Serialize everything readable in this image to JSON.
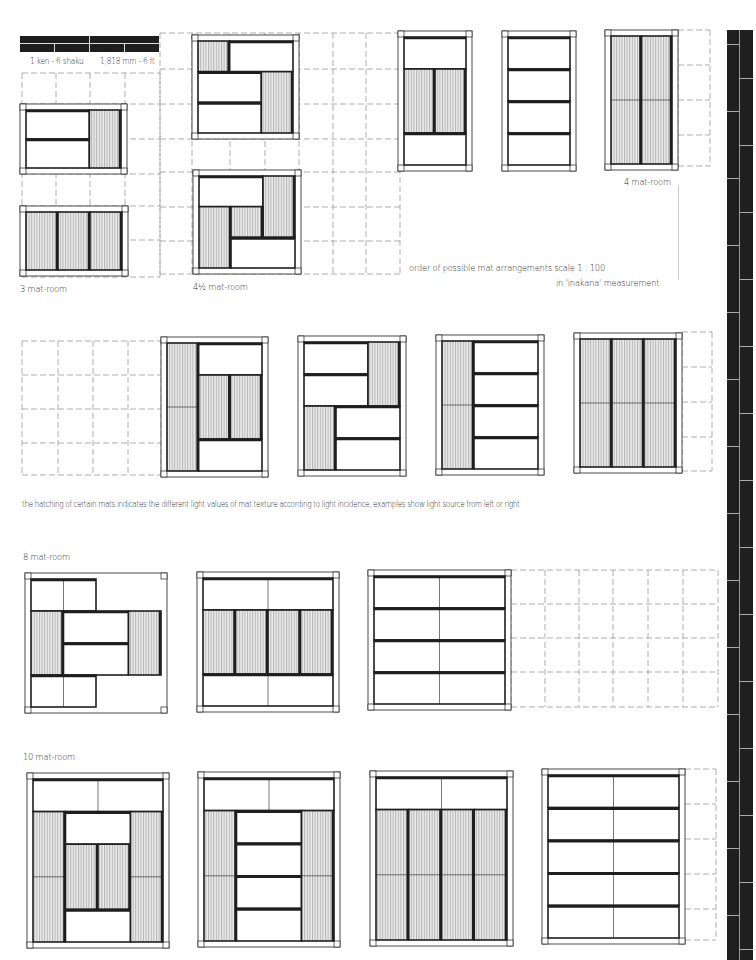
{
  "scale_bar": {
    "label_left": "1 ken - 6 shaku",
    "label_right": "1,818 mm - 6 ft"
  },
  "labels": {
    "three_mat": "3 mat-room",
    "four_half_mat": "4½ mat-room",
    "four_mat": "4 mat-room",
    "order_line1": "order of possible mat arrangements    scale   1 : 100",
    "order_line2": "in 'inakana' measurement",
    "hatching_note": "the hatching of certain mats indicates  the different light values of mat texture according to light incidence, examples show light source from left or right",
    "eight_mat": "8 mat-room",
    "ten_mat": "10 mat-room"
  },
  "colors": {
    "ink": "#1e1e1e",
    "hatch_bg": "#e8e8e8",
    "hatch_line": "#9a9a9a",
    "grid_dash": "#9a9a9a",
    "paper": "#ffffff"
  },
  "rooms": [
    {
      "id": "r3a",
      "group": "3 mat-room",
      "x": 20,
      "y": 104,
      "w": 107,
      "h": 70,
      "mats": [
        [
          0,
          0,
          2,
          1,
          "h"
        ],
        [
          0,
          1,
          2,
          1,
          "h"
        ],
        [
          2,
          0,
          1,
          2,
          "v"
        ]
      ],
      "cols": 3,
      "rows": 2
    },
    {
      "id": "r3b",
      "group": "3 mat-room",
      "x": 20,
      "y": 206,
      "w": 108,
      "h": 70,
      "mats": [
        [
          0,
          0,
          1,
          2,
          "v"
        ],
        [
          1,
          0,
          1,
          2,
          "v"
        ],
        [
          2,
          0,
          1,
          2,
          "v"
        ]
      ],
      "cols": 3,
      "rows": 2
    },
    {
      "id": "r45a",
      "group": "4½ mat-room",
      "x": 192,
      "y": 35,
      "w": 107,
      "h": 104,
      "mats": [
        [
          0,
          0,
          1,
          1,
          "v",
          "sq"
        ],
        [
          1,
          0,
          2,
          1,
          "h"
        ],
        [
          0,
          1,
          2,
          1,
          "h"
        ],
        [
          0,
          2,
          2,
          1,
          "h"
        ],
        [
          2,
          1,
          1,
          2,
          "v"
        ]
      ],
      "cols": 3,
      "rows": 3
    },
    {
      "id": "r45b",
      "group": "4½ mat-room",
      "x": 193,
      "y": 170,
      "w": 108,
      "h": 104,
      "mats": [
        [
          0,
          0,
          2,
          1,
          "h"
        ],
        [
          2,
          0,
          1,
          2,
          "v"
        ],
        [
          0,
          1,
          1,
          2,
          "v"
        ],
        [
          1,
          1,
          1,
          1,
          "v",
          "sq"
        ],
        [
          1,
          2,
          2,
          1,
          "h"
        ]
      ],
      "cols": 3,
      "rows": 3
    },
    {
      "id": "r4a",
      "group": "4 mat-room",
      "x": 398,
      "y": 31,
      "w": 74,
      "h": 140,
      "mats": [
        [
          0,
          0,
          2,
          1,
          "h"
        ],
        [
          0,
          1,
          1,
          2,
          "v"
        ],
        [
          1,
          1,
          1,
          2,
          "v"
        ],
        [
          0,
          3,
          2,
          1,
          "h"
        ]
      ],
      "cols": 2,
      "rows": 4
    },
    {
      "id": "r4b",
      "group": "4 mat-room",
      "x": 502,
      "y": 31,
      "w": 74,
      "h": 140,
      "mats": [
        [
          0,
          0,
          2,
          1,
          "h"
        ],
        [
          0,
          1,
          2,
          1,
          "h"
        ],
        [
          0,
          2,
          2,
          1,
          "h"
        ],
        [
          0,
          3,
          2,
          1,
          "h"
        ]
      ],
      "cols": 2,
      "rows": 4
    },
    {
      "id": "r4c",
      "group": "4 mat-room",
      "x": 605,
      "y": 30,
      "w": 73,
      "h": 140,
      "mats": [
        [
          0,
          0,
          1,
          4,
          "v",
          "split"
        ],
        [
          1,
          0,
          1,
          4,
          "v",
          "split"
        ]
      ],
      "cols": 2,
      "rows": 4
    },
    {
      "id": "r6a",
      "group": "6 mat-room",
      "x": 161,
      "y": 337,
      "w": 107,
      "h": 140,
      "mats": [
        [
          0,
          0,
          1,
          4,
          "v",
          "split"
        ],
        [
          1,
          0,
          2,
          1,
          "h"
        ],
        [
          1,
          1,
          1,
          2,
          "v"
        ],
        [
          2,
          1,
          1,
          2,
          "v"
        ],
        [
          1,
          3,
          2,
          1,
          "h"
        ]
      ],
      "cols": 3,
      "rows": 4
    },
    {
      "id": "r6b",
      "group": "6 mat-room",
      "x": 298,
      "y": 336,
      "w": 108,
      "h": 140,
      "mats": [
        [
          0,
          0,
          2,
          1,
          "h"
        ],
        [
          0,
          1,
          2,
          1,
          "h"
        ],
        [
          2,
          0,
          1,
          2,
          "v"
        ],
        [
          0,
          2,
          1,
          2,
          "v"
        ],
        [
          1,
          2,
          2,
          1,
          "h"
        ],
        [
          1,
          3,
          2,
          1,
          "h"
        ]
      ],
      "cols": 3,
      "rows": 4
    },
    {
      "id": "r6c",
      "group": "6 mat-room",
      "x": 436,
      "y": 335,
      "w": 108,
      "h": 140,
      "mats": [
        [
          0,
          0,
          1,
          4,
          "v",
          "split"
        ],
        [
          1,
          0,
          2,
          1,
          "h"
        ],
        [
          1,
          1,
          2,
          1,
          "h"
        ],
        [
          1,
          2,
          2,
          1,
          "h"
        ],
        [
          1,
          3,
          2,
          1,
          "h"
        ]
      ],
      "cols": 3,
      "rows": 4
    },
    {
      "id": "r6d",
      "group": "6 mat-room",
      "x": 574,
      "y": 333,
      "w": 108,
      "h": 140,
      "mats": [
        [
          0,
          0,
          1,
          4,
          "v",
          "split"
        ],
        [
          1,
          0,
          1,
          4,
          "v",
          "split"
        ],
        [
          2,
          0,
          1,
          4,
          "v",
          "split"
        ]
      ],
      "cols": 3,
      "rows": 4
    },
    {
      "id": "r8a",
      "group": "8 mat-room",
      "x": 25,
      "y": 573,
      "w": 142,
      "h": 140,
      "mats": [
        [
          0,
          0,
          2,
          1,
          "h",
          "split"
        ],
        [
          0,
          1,
          1,
          2,
          "v"
        ],
        [
          1,
          1,
          2,
          1,
          "h"
        ],
        [
          1,
          2,
          2,
          1,
          "h"
        ],
        [
          3,
          1,
          1,
          2,
          "v"
        ],
        [
          0,
          3,
          2,
          1,
          "h",
          "split"
        ]
      ],
      "cols": 4,
      "rows": 4
    },
    {
      "id": "r8b",
      "group": "8 mat-room",
      "x": 197,
      "y": 572,
      "w": 142,
      "h": 140,
      "mats": [
        [
          0,
          0,
          4,
          1,
          "h",
          "split"
        ],
        [
          0,
          1,
          1,
          2,
          "v"
        ],
        [
          1,
          1,
          1,
          2,
          "v"
        ],
        [
          2,
          1,
          1,
          2,
          "v"
        ],
        [
          3,
          1,
          1,
          2,
          "v"
        ],
        [
          0,
          3,
          4,
          1,
          "h",
          "split"
        ]
      ],
      "cols": 4,
      "rows": 4
    },
    {
      "id": "r8c",
      "group": "8 mat-room",
      "x": 368,
      "y": 570,
      "w": 143,
      "h": 140,
      "mats": [
        [
          0,
          0,
          4,
          1,
          "h",
          "split"
        ],
        [
          0,
          1,
          4,
          1,
          "h",
          "split"
        ],
        [
          0,
          2,
          4,
          1,
          "h",
          "split"
        ],
        [
          0,
          3,
          4,
          1,
          "h",
          "split"
        ]
      ],
      "cols": 4,
      "rows": 4
    },
    {
      "id": "r10a",
      "group": "10 mat-room",
      "x": 27,
      "y": 773,
      "w": 142,
      "h": 175,
      "mats": [
        [
          0,
          0,
          4,
          1,
          "h",
          "split"
        ],
        [
          0,
          1,
          1,
          4,
          "v",
          "split"
        ],
        [
          1,
          1,
          2,
          1,
          "h"
        ],
        [
          1,
          2,
          1,
          2,
          "v"
        ],
        [
          2,
          2,
          1,
          2,
          "v"
        ],
        [
          1,
          4,
          2,
          1,
          "h"
        ],
        [
          3,
          1,
          1,
          4,
          "v",
          "split"
        ]
      ],
      "cols": 4,
      "rows": 5
    },
    {
      "id": "r10b",
      "group": "10 mat-room",
      "x": 198,
      "y": 772,
      "w": 142,
      "h": 175,
      "mats": [
        [
          0,
          0,
          4,
          1,
          "h",
          "split"
        ],
        [
          0,
          1,
          1,
          4,
          "v",
          "split"
        ],
        [
          1,
          1,
          2,
          1,
          "h"
        ],
        [
          1,
          2,
          2,
          1,
          "h"
        ],
        [
          1,
          3,
          2,
          1,
          "h"
        ],
        [
          1,
          4,
          2,
          1,
          "h"
        ],
        [
          3,
          1,
          1,
          4,
          "v",
          "split"
        ]
      ],
      "cols": 4,
      "rows": 5
    },
    {
      "id": "r10c",
      "group": "10 mat-room",
      "x": 370,
      "y": 771,
      "w": 143,
      "h": 175,
      "mats": [
        [
          0,
          0,
          4,
          1,
          "h",
          "split"
        ],
        [
          0,
          1,
          1,
          4,
          "v",
          "split"
        ],
        [
          1,
          1,
          1,
          4,
          "v",
          "split"
        ],
        [
          2,
          1,
          1,
          4,
          "v",
          "split"
        ],
        [
          3,
          1,
          1,
          4,
          "v",
          "split"
        ]
      ],
      "cols": 4,
      "rows": 5
    },
    {
      "id": "r10d",
      "group": "10 mat-room",
      "x": 542,
      "y": 769,
      "w": 143,
      "h": 175,
      "mats": [
        [
          0,
          0,
          4,
          1,
          "h",
          "split"
        ],
        [
          0,
          1,
          4,
          1,
          "h",
          "split"
        ],
        [
          0,
          2,
          4,
          1,
          "h",
          "split"
        ],
        [
          0,
          3,
          4,
          1,
          "h",
          "split"
        ],
        [
          0,
          4,
          4,
          1,
          "h",
          "split"
        ]
      ],
      "cols": 4,
      "rows": 5
    }
  ],
  "grids": [
    {
      "id": "g-top-left",
      "x0": 22,
      "y0": 73,
      "x1": 160,
      "y1": 277,
      "cols": [
        22,
        56,
        90,
        125,
        160
      ],
      "rows": [
        73,
        104,
        139,
        174,
        206,
        240,
        277
      ]
    },
    {
      "id": "g-top-mid",
      "x0": 160,
      "y0": 33,
      "x1": 400,
      "y1": 274,
      "cols": [
        160,
        192,
        230,
        265,
        299,
        333,
        366,
        400
      ],
      "rows": [
        33,
        69,
        104,
        139,
        172,
        207,
        241,
        274
      ]
    },
    {
      "id": "g-top-right",
      "x0": 678,
      "y0": 30,
      "x1": 710,
      "y1": 166,
      "cols": [
        678,
        710
      ],
      "rows": [
        30,
        65,
        100,
        135,
        166
      ]
    },
    {
      "id": "g-mid-left",
      "x0": 22,
      "y0": 341,
      "x1": 161,
      "y1": 475,
      "cols": [
        22,
        58,
        93,
        128,
        161
      ],
      "rows": [
        341,
        375,
        409,
        443,
        475
      ]
    },
    {
      "id": "g-mid-right",
      "x0": 682,
      "y0": 332,
      "x1": 712,
      "y1": 471,
      "cols": [
        682,
        712
      ],
      "rows": [
        332,
        367,
        402,
        437,
        471
      ]
    },
    {
      "id": "g-8-right",
      "x0": 511,
      "y0": 570,
      "x1": 718,
      "y1": 707,
      "cols": [
        511,
        545,
        579,
        613,
        648,
        683,
        718
      ],
      "rows": [
        570,
        604,
        638,
        672,
        707
      ]
    },
    {
      "id": "g-10-right",
      "x0": 685,
      "y0": 769,
      "x1": 716,
      "y1": 940,
      "cols": [
        716
      ],
      "rows": [
        769,
        804,
        839,
        874,
        909,
        940
      ]
    }
  ]
}
